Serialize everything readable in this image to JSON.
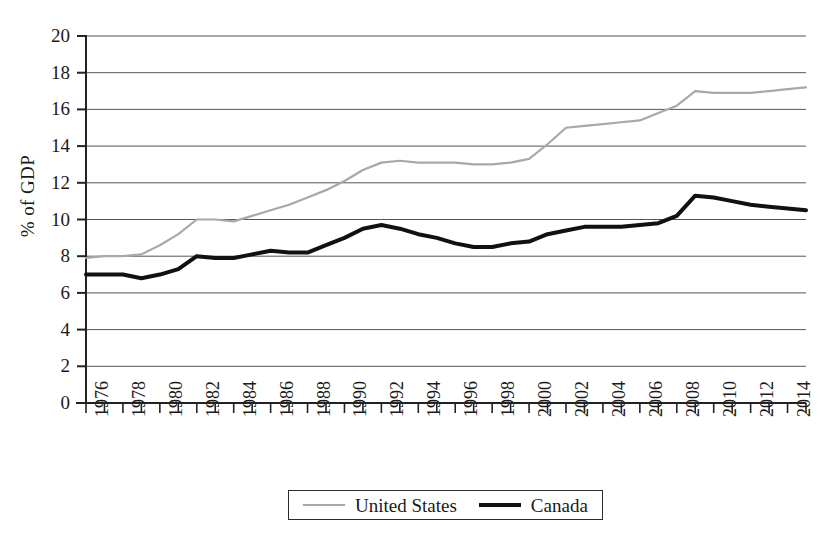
{
  "chart_data": {
    "type": "line",
    "title": "",
    "xlabel": "",
    "ylabel": "% of GDP",
    "ylim": [
      0,
      20
    ],
    "ytick_step": 2,
    "yticks": [
      0,
      2,
      4,
      6,
      8,
      10,
      12,
      14,
      16,
      18,
      20
    ],
    "xlim": [
      1976,
      2015
    ],
    "xtick_labels": [
      "1976",
      "1978",
      "1980",
      "1982",
      "1984",
      "1986",
      "1988",
      "1990",
      "1992",
      "1994",
      "1996",
      "1998",
      "2000",
      "2002",
      "2004",
      "2006",
      "2008",
      "2010",
      "2012",
      "2014"
    ],
    "minor_xticks_every": 1,
    "grid": "horizontal",
    "legend_position": "bottom-center",
    "x": [
      1976,
      1977,
      1978,
      1979,
      1980,
      1981,
      1982,
      1983,
      1984,
      1985,
      1986,
      1987,
      1988,
      1989,
      1990,
      1991,
      1992,
      1993,
      1994,
      1995,
      1996,
      1997,
      1998,
      1999,
      2000,
      2001,
      2002,
      2003,
      2004,
      2005,
      2006,
      2007,
      2008,
      2009,
      2010,
      2011,
      2012,
      2013,
      2014,
      2015
    ],
    "series": [
      {
        "name": "United States",
        "color": "#a8a8a8",
        "width": 2.2,
        "values": [
          7.9,
          8.0,
          8.0,
          8.1,
          8.6,
          9.2,
          10.0,
          10.0,
          9.9,
          10.2,
          10.5,
          10.8,
          11.2,
          11.6,
          12.1,
          12.7,
          13.1,
          13.2,
          13.1,
          13.1,
          13.1,
          13.0,
          13.0,
          13.1,
          13.3,
          14.1,
          15.0,
          15.1,
          15.2,
          15.3,
          15.4,
          15.8,
          16.2,
          17.0,
          16.9,
          16.9,
          16.9,
          17.0,
          17.1,
          17.2
        ]
      },
      {
        "name": "Canada",
        "color": "#111111",
        "width": 4.0,
        "values": [
          7.0,
          7.0,
          7.0,
          6.8,
          7.0,
          7.3,
          8.0,
          7.9,
          7.9,
          8.1,
          8.3,
          8.2,
          8.2,
          8.6,
          9.0,
          9.5,
          9.7,
          9.5,
          9.2,
          9.0,
          8.7,
          8.5,
          8.5,
          8.7,
          8.8,
          9.2,
          9.4,
          9.6,
          9.6,
          9.6,
          9.7,
          9.8,
          10.2,
          11.3,
          11.2,
          11.0,
          10.8,
          10.7,
          10.6,
          10.5
        ]
      }
    ]
  },
  "legend": {
    "items": [
      {
        "label": "United States",
        "style": "us"
      },
      {
        "label": "Canada",
        "style": "ca"
      }
    ]
  },
  "axes": {
    "y_title": "% of GDP"
  }
}
